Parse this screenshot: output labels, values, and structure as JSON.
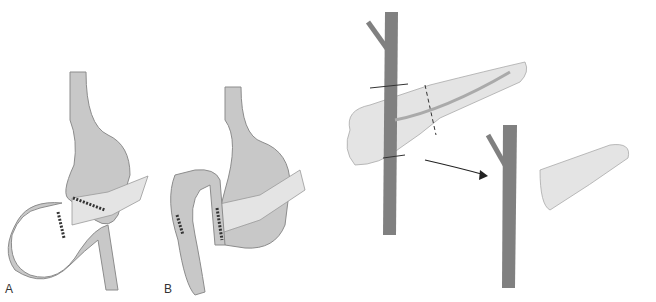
{
  "panels": [
    {
      "id": "A",
      "label": "A",
      "description": "Gastrojejunostomy loop with stapled anastomosis"
    },
    {
      "id": "B",
      "label": "B",
      "description": "Roux-type loop with sutured anastomosis"
    },
    {
      "id": "C",
      "label": "",
      "description": "Portal vein with pancreas transection lines and resected pancreatic tail"
    }
  ],
  "colors": {
    "organ_fill": "#c8c8c8",
    "organ_outline": "#8c8c8c",
    "pancreas_fill": "#e4e4e4",
    "vessel_fill": "#808080",
    "staple": "#333333",
    "background": "#ffffff"
  }
}
